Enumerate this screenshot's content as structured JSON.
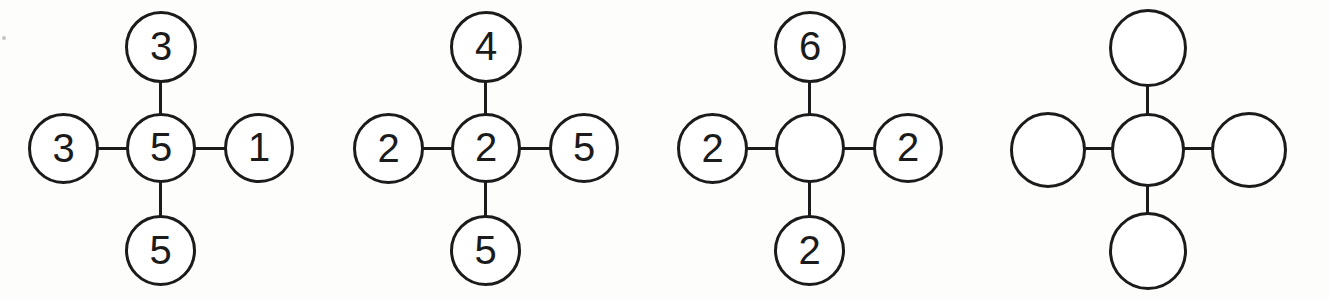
{
  "worksheet": {
    "background_color": "#fdfdfc",
    "stroke_color": "#1b1b1b",
    "text_color": "#1b1b1b",
    "layout": "four cross-shaped (plus) number diagrams in a single row",
    "node_count_per_group": 5,
    "edge_count_per_group": 4
  },
  "groups": [
    {
      "id": "group-1",
      "label": "cross-diagram-1",
      "nodes": {
        "top": "3",
        "left": "3",
        "center": "5",
        "right": "1",
        "bottom": "5"
      }
    },
    {
      "id": "group-2",
      "label": "cross-diagram-2",
      "nodes": {
        "top": "4",
        "left": "2",
        "center": "2",
        "right": "5",
        "bottom": "5"
      }
    },
    {
      "id": "group-3",
      "label": "cross-diagram-3",
      "nodes": {
        "top": "6",
        "left": "2",
        "center": "",
        "right": "2",
        "bottom": "2"
      }
    },
    {
      "id": "group-4",
      "label": "cross-diagram-4",
      "nodes": {
        "top": "",
        "left": "",
        "center": "",
        "right": "",
        "bottom": ""
      }
    }
  ]
}
